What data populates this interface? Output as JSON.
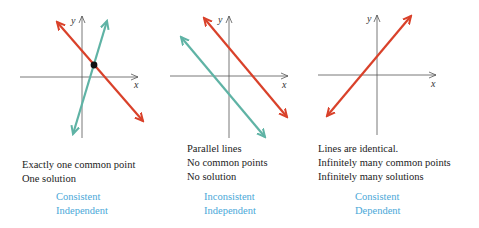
{
  "colors": {
    "red_line": "#d9412a",
    "teal_line": "#5fb3a5",
    "axis": "#555555",
    "classification": "#4aa8d8",
    "text": "#222222"
  },
  "panels": [
    {
      "axis_x_label": "x",
      "axis_y_label": "y",
      "captions": [
        "Exactly one common point",
        "One solution"
      ],
      "classification": [
        "Consistent",
        "Independent"
      ]
    },
    {
      "axis_x_label": "x",
      "axis_y_label": "y",
      "captions": [
        "Parallel lines",
        "No common points",
        "No solution"
      ],
      "classification": [
        "Inconsistent",
        "Independent"
      ]
    },
    {
      "axis_x_label": "x",
      "axis_y_label": "y",
      "captions": [
        "Lines are identical.",
        "Infinitely many common points",
        "Infinitely many solutions"
      ],
      "classification": [
        "Consistent",
        "Dependent"
      ]
    }
  ]
}
